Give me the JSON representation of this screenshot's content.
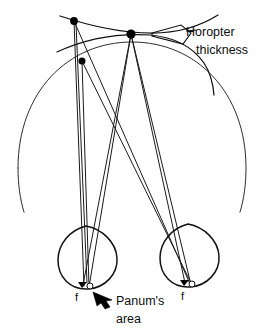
{
  "figure": {
    "background_color": "#ffffff",
    "line_color": "#111111"
  },
  "annotations": {
    "horopter_label_line1": "Horopter",
    "horopter_label_line2": "thickness",
    "panum_label_line1": "Panum's",
    "panum_label_line2": "area",
    "left_fovea_label": "f",
    "right_fovea_label": "f"
  },
  "markers": {
    "fixation_point": {
      "name": "fixation-point",
      "x": 131,
      "y": 34,
      "r": 4.6
    },
    "upper_left_point": {
      "name": "upper-left-target-point",
      "x": 74,
      "y": 21,
      "r": 3.9
    },
    "mid_left_point": {
      "name": "mid-left-target-point",
      "x": 82,
      "y": 61,
      "r": 3.5
    },
    "left_fovea_triangle": {
      "name": "left-fovea-marker",
      "x": 82,
      "y": 285
    },
    "left_panum_circle": {
      "name": "left-panum-circle",
      "x": 90,
      "y": 286,
      "r": 3.0
    },
    "right_fovea_triangle": {
      "name": "right-fovea-marker",
      "x": 184,
      "y": 283
    },
    "right_panum_circle": {
      "name": "right-panum-circle",
      "x": 192,
      "y": 284,
      "r": 3.0
    }
  },
  "curves": {
    "vieth_muller_circle": "large arc through fixation point and both eyes",
    "horopter_outer_arc": "upper flattened arc",
    "horopter_inner_arc": "lower flattened arc forming thickness band"
  },
  "eyes": {
    "left": {
      "name": "left-eye",
      "cx": 88,
      "cy": 253
    },
    "right": {
      "name": "right-eye",
      "cx": 190,
      "cy": 251
    }
  }
}
